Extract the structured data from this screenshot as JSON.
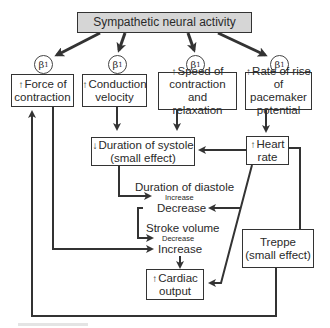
{
  "title": "Sympathetic neural activity",
  "receptor_label": "β",
  "receptor_sub": "1",
  "effects": [
    {
      "arrow": "↑",
      "line1": "Force of",
      "line2": "contraction",
      "line3": ""
    },
    {
      "arrow": "↑",
      "line1": "Conduction",
      "line2": "velocity",
      "line3": ""
    },
    {
      "arrow": "↑",
      "line1": "Speed of",
      "line2": "contraction and",
      "line3": "relaxation"
    },
    {
      "arrow": "↑",
      "line1": "Rate of rise",
      "line2": "of pacemaker",
      "line3": "potential"
    }
  ],
  "systole": {
    "arrow": "↓",
    "line1": "Duration of systole",
    "line2": "(small effect)"
  },
  "heart_rate": {
    "arrow": "↑",
    "line1": "Heart",
    "line2": "rate"
  },
  "diastole": {
    "label": "Duration of diastole",
    "sub": "Increase",
    "result": "Decrease"
  },
  "stroke_volume": {
    "label": "Stroke volume",
    "sub": "Decrease",
    "result": "Increase"
  },
  "cardiac_output": {
    "arrow": "↑",
    "line1": "Cardiac",
    "line2": "output"
  },
  "treppe": {
    "line1": "Treppe",
    "line2": "(small effect)"
  },
  "colors": {
    "line": "#333333",
    "title_fill": "#d6d6d6",
    "box_border": "#333333"
  }
}
